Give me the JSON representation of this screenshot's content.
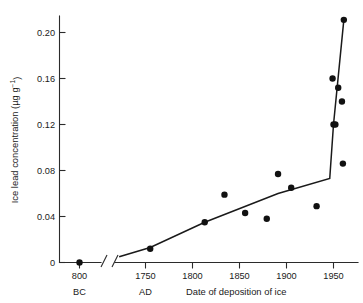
{
  "chart_data": {
    "type": "scatter",
    "title": "",
    "xlabel": "Date of deposition of ice",
    "ylabel": "Ice lead concentration (µg g⁻¹)",
    "ylabel_main": "Ice lead concentration (µg g",
    "ylabel_exponent": "−1",
    "ylabel_tail": ")",
    "era_left": "BC",
    "era_right": "AD",
    "axis_break": true,
    "ylim": [
      0,
      0.215
    ],
    "yticks": [
      0,
      0.04,
      0.08,
      0.12,
      0.16,
      0.2
    ],
    "ytick_labels": [
      "0",
      "0.04",
      "0.08",
      "0.12",
      "0.16",
      "0.20"
    ],
    "xticks_left": [
      -800
    ],
    "xtick_labels_left": [
      "800"
    ],
    "xticks_right": [
      1750,
      1800,
      1850,
      1900,
      1950
    ],
    "xtick_labels_right": [
      "1750",
      "1800",
      "1850",
      "1900",
      "1950"
    ],
    "xlim_left": [
      -900,
      -700
    ],
    "xlim_right": [
      1715,
      1975
    ],
    "grid": false,
    "legend": null,
    "series": [
      {
        "name": "Ice lead concentration measurements",
        "marker": "filled-circle",
        "color": "#111111",
        "points_left_panel": [
          {
            "x": -800,
            "y": 0.0
          }
        ],
        "points_right_panel": [
          {
            "x": 1755,
            "y": 0.012
          },
          {
            "x": 1813,
            "y": 0.035
          },
          {
            "x": 1834,
            "y": 0.059
          },
          {
            "x": 1856,
            "y": 0.043
          },
          {
            "x": 1879,
            "y": 0.038
          },
          {
            "x": 1891,
            "y": 0.077
          },
          {
            "x": 1905,
            "y": 0.065
          },
          {
            "x": 1932,
            "y": 0.049
          },
          {
            "x": 1949,
            "y": 0.16
          },
          {
            "x": 1950,
            "y": 0.12
          },
          {
            "x": 1952,
            "y": 0.12
          },
          {
            "x": 1955,
            "y": 0.152
          },
          {
            "x": 1959,
            "y": 0.14
          },
          {
            "x": 1960,
            "y": 0.086
          },
          {
            "x": 1961,
            "y": 0.211
          }
        ]
      }
    ],
    "trend_line": {
      "name": "fitted trend",
      "color": "#1a1a1a",
      "points": [
        {
          "x": 1722,
          "y": 0.005
        },
        {
          "x": 1755,
          "y": 0.013
        },
        {
          "x": 1813,
          "y": 0.035
        },
        {
          "x": 1891,
          "y": 0.06
        },
        {
          "x": 1946,
          "y": 0.073
        },
        {
          "x": 1950,
          "y": 0.12
        },
        {
          "x": 1961,
          "y": 0.211
        }
      ]
    }
  }
}
